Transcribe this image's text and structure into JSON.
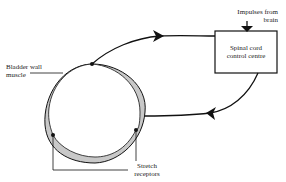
{
  "diagram": {
    "type": "reflex-loop",
    "labels": {
      "bladder_wall_muscle": [
        "Bladder wall",
        "muscle"
      ],
      "impulses_from_brain": [
        "Impulses from",
        "brain"
      ],
      "control_centre": [
        "Spinal cord",
        "control centre"
      ],
      "stretch_receptors": [
        "Stretch",
        "receptors"
      ]
    },
    "nodes": [
      {
        "id": "bladder",
        "shape": "circle",
        "label": "Bladder wall muscle"
      },
      {
        "id": "control",
        "shape": "box",
        "label": "Spinal cord control centre"
      },
      {
        "id": "brain-input",
        "shape": "arrow",
        "label": "Impulses from brain"
      }
    ],
    "edges": [
      {
        "from": "bladder",
        "to": "control",
        "direction": "forward",
        "note": "sensory pathway from stretch receptors"
      },
      {
        "from": "control",
        "to": "bladder",
        "direction": "forward",
        "note": "motor pathway to bladder wall"
      },
      {
        "from": "brain-input",
        "to": "control",
        "direction": "forward"
      }
    ],
    "colors": {
      "line": "#111111",
      "muscle_fill": "#c8c8c8",
      "background": "#ffffff"
    }
  }
}
